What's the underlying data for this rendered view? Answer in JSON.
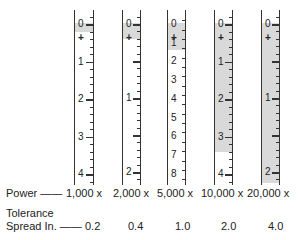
{
  "diagram": {
    "row_labels": {
      "power": "Power",
      "tolerance_line1": "Tolerance",
      "tolerance_line2": "Spread In.",
      "dash": "——"
    },
    "scales": [
      {
        "power": "1,000 x",
        "tolerance": "0.2",
        "labels": [
          "0",
          "+",
          "1",
          "2",
          "3",
          "4"
        ],
        "major_values": [
          0,
          1,
          2,
          3,
          4
        ],
        "units_per_px": 37.5,
        "max": 4.3,
        "shade_to": 0.2,
        "x": 74,
        "w": 20
      },
      {
        "power": "2,000 x",
        "tolerance": "0.4",
        "labels": [
          "0",
          "+",
          "1",
          "2"
        ],
        "major_values": [
          0,
          1,
          2
        ],
        "units_per_px": 74,
        "max": 2.15,
        "shade_to": 0.2,
        "x": 122,
        "w": 19
      },
      {
        "power": "5,000 x",
        "tolerance": "1.0",
        "labels": [
          "0",
          "+",
          "1",
          "2",
          "3",
          "4",
          "5",
          "6",
          "7",
          "8"
        ],
        "major_values": [
          0,
          1,
          2,
          3,
          4,
          5,
          6,
          7,
          8
        ],
        "units_per_px": 18.7,
        "max": 8.6,
        "shade_to": 1.4,
        "x": 167,
        "w": 19
      },
      {
        "power": "10,000 x",
        "tolerance": "2.0",
        "labels": [
          "0",
          "+",
          "1",
          "2",
          "3",
          "4"
        ],
        "major_values": [
          0,
          1,
          2,
          3,
          4
        ],
        "units_per_px": 37.5,
        "max": 4.3,
        "shade_to": 3.4,
        "x": 214,
        "w": 19
      },
      {
        "power": "20,000 x",
        "tolerance": "4.0",
        "labels": [
          "0",
          "+",
          "1",
          "2"
        ],
        "major_values": [
          0,
          1,
          2
        ],
        "units_per_px": 74,
        "max": 2.15,
        "shade_to": 2.15,
        "x": 261,
        "w": 19
      }
    ],
    "colors": {
      "shade": "#d9d9d9",
      "line": "#333333",
      "text": "#222222"
    }
  }
}
